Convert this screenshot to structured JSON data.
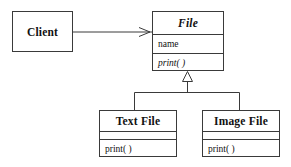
{
  "diagram": {
    "type": "uml-class-diagram",
    "title": "",
    "background_color": "#ffffff",
    "line_color": "#3a3a3a",
    "text_color": "#111111",
    "classes": [
      {
        "id": "client",
        "name": "Client",
        "abstract": false,
        "attributes": [],
        "operations": [],
        "compartments_shown": 1
      },
      {
        "id": "file",
        "name": "File",
        "abstract": true,
        "attributes": [
          "name"
        ],
        "operations": [
          "print( )"
        ],
        "compartments_shown": 3
      },
      {
        "id": "textfile",
        "name": "Text File",
        "abstract": false,
        "attributes": [],
        "operations": [
          "print( )"
        ],
        "compartments_shown": 3
      },
      {
        "id": "imagefile",
        "name": "Image File",
        "abstract": false,
        "attributes": [],
        "operations": [
          "print( )"
        ],
        "compartments_shown": 3
      }
    ],
    "relationships": [
      {
        "id": "client-uses-file",
        "kind": "association",
        "arrowhead": "open-arrow",
        "from": "Client",
        "to": "File",
        "label": ""
      },
      {
        "id": "textfile-inherits-file",
        "kind": "generalization",
        "arrowhead": "hollow-triangle",
        "from": "Text File",
        "to": "File",
        "label": ""
      },
      {
        "id": "imagefile-inherits-file",
        "kind": "generalization",
        "arrowhead": "hollow-triangle",
        "from": "Image File",
        "to": "File",
        "label": ""
      }
    ]
  }
}
